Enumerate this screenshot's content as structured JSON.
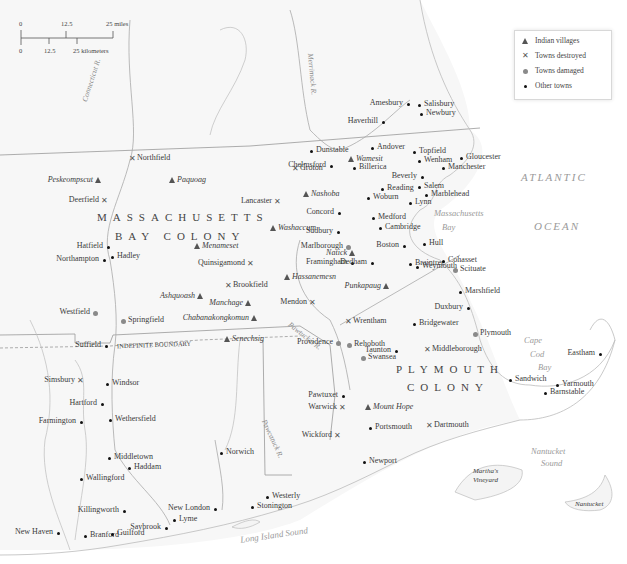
{
  "scale_bar": {
    "miles": [
      "0",
      "12.5",
      "25 miles"
    ],
    "kilometers": [
      "0",
      "12.5",
      "25 kilometers"
    ]
  },
  "legend": {
    "items": [
      {
        "symbol": "triangle",
        "label": "Indian villages"
      },
      {
        "symbol": "x-mark",
        "label": "Towns destroyed"
      },
      {
        "symbol": "gray-dot",
        "label": "Towns damaged"
      },
      {
        "symbol": "black-dot",
        "label": "Other towns"
      }
    ]
  },
  "regions": {
    "massachusetts_line1": "MASSACHUSETTS",
    "massachusetts_line2": "BAY COLONY",
    "plymouth_line1": "PLYMOUTH",
    "plymouth_line2": "COLONY",
    "indefinite_boundary": "INDEFINITE BOUNDARY"
  },
  "water": {
    "atlantic": "ATLANTIC",
    "ocean": "OCEAN",
    "mass_bay_1": "Massachusetts",
    "mass_bay_2": "Bay",
    "cape_cod_1": "Cape",
    "cape_cod_2": "Cod",
    "cape_cod_3": "Bay",
    "nantucket_sound_1": "Nantucket",
    "nantucket_sound_2": "Sound",
    "long_island_sound": "Long Island Sound",
    "marthas_vineyard_1": "Martha's",
    "marthas_vineyard_2": "Vineyard",
    "nantucket": "Nantucket"
  },
  "rivers": {
    "connecticut": "Connecticut R.",
    "merrimack": "Merrimack R.",
    "pawtucket": "Pawtucket R.",
    "pawcatuck": "Pawcatuck R."
  },
  "places": {
    "indian_villages": [
      {
        "name": "Peskeompscut",
        "x": 98,
        "y": 181
      },
      {
        "name": "Paquoag",
        "x": 172,
        "y": 181
      },
      {
        "name": "Wamesit",
        "x": 351,
        "y": 160
      },
      {
        "name": "Nashoba",
        "x": 306,
        "y": 195
      },
      {
        "name": "Washaccum",
        "x": 273,
        "y": 229
      },
      {
        "name": "Menameset",
        "x": 197,
        "y": 247
      },
      {
        "name": "Natick",
        "x": 352,
        "y": 254
      },
      {
        "name": "Hassanemesn",
        "x": 287,
        "y": 278
      },
      {
        "name": "Punkapaug",
        "x": 386,
        "y": 287
      },
      {
        "name": "Ashquoash",
        "x": 200,
        "y": 297
      },
      {
        "name": "Manchage",
        "x": 248,
        "y": 304
      },
      {
        "name": "Chabanakongkomun",
        "x": 254,
        "y": 319
      },
      {
        "name": "Senechsig",
        "x": 227,
        "y": 340
      },
      {
        "name": "Mount Hope",
        "x": 368,
        "y": 408
      }
    ],
    "towns_destroyed": [
      {
        "name": "Northfield",
        "x": 132,
        "y": 159
      },
      {
        "name": "Deerfield",
        "x": 104,
        "y": 201
      },
      {
        "name": "Groton",
        "x": 295,
        "y": 169
      },
      {
        "name": "Lancaster",
        "x": 277,
        "y": 202
      },
      {
        "name": "Quinsigamond",
        "x": 250,
        "y": 264
      },
      {
        "name": "Brookfield",
        "x": 228,
        "y": 286
      },
      {
        "name": "Mendon",
        "x": 312,
        "y": 303
      },
      {
        "name": "Wrentham",
        "x": 348,
        "y": 322
      },
      {
        "name": "Middleborough",
        "x": 427,
        "y": 350
      },
      {
        "name": "Simsbury",
        "x": 80,
        "y": 381
      },
      {
        "name": "Warwick",
        "x": 342,
        "y": 408
      },
      {
        "name": "Wickford",
        "x": 337,
        "y": 436
      },
      {
        "name": "Dartmouth",
        "x": 429,
        "y": 426
      }
    ],
    "towns_damaged": [
      {
        "name": "Marlborough",
        "x": 348,
        "y": 247
      },
      {
        "name": "Westfield",
        "x": 95,
        "y": 313
      },
      {
        "name": "Springfield",
        "x": 123,
        "y": 321
      },
      {
        "name": "Providence",
        "x": 338,
        "y": 343
      },
      {
        "name": "Rehoboth",
        "x": 349,
        "y": 345
      },
      {
        "name": "Swansea",
        "x": 363,
        "y": 358
      },
      {
        "name": "Scituate",
        "x": 455,
        "y": 270
      },
      {
        "name": "Plymouth",
        "x": 475,
        "y": 334
      }
    ],
    "other_towns": [
      {
        "name": "Amesbury",
        "x": 408,
        "y": 104
      },
      {
        "name": "Salisbury",
        "x": 419,
        "y": 105
      },
      {
        "name": "Newbury",
        "x": 421,
        "y": 114
      },
      {
        "name": "Haverhill",
        "x": 383,
        "y": 122
      },
      {
        "name": "Dunstable",
        "x": 311,
        "y": 151
      },
      {
        "name": "Andover",
        "x": 372,
        "y": 148
      },
      {
        "name": "Topfield",
        "x": 414,
        "y": 152
      },
      {
        "name": "Wenham",
        "x": 419,
        "y": 161
      },
      {
        "name": "Gloucester",
        "x": 461,
        "y": 158
      },
      {
        "name": "Manchester",
        "x": 443,
        "y": 168
      },
      {
        "name": "Chelmsford",
        "x": 331,
        "y": 166
      },
      {
        "name": "Billerica",
        "x": 354,
        "y": 168
      },
      {
        "name": "Beverly",
        "x": 422,
        "y": 177
      },
      {
        "name": "Salem",
        "x": 419,
        "y": 187
      },
      {
        "name": "Reading",
        "x": 382,
        "y": 189
      },
      {
        "name": "Marblehead",
        "x": 426,
        "y": 195
      },
      {
        "name": "Woburn",
        "x": 368,
        "y": 198
      },
      {
        "name": "Lynn",
        "x": 410,
        "y": 203
      },
      {
        "name": "Concord",
        "x": 339,
        "y": 213
      },
      {
        "name": "Medford",
        "x": 373,
        "y": 218
      },
      {
        "name": "Cambridge",
        "x": 380,
        "y": 228
      },
      {
        "name": "Sudbury",
        "x": 338,
        "y": 232
      },
      {
        "name": "Boston",
        "x": 404,
        "y": 246
      },
      {
        "name": "Hull",
        "x": 424,
        "y": 244
      },
      {
        "name": "Framingham",
        "x": 352,
        "y": 263
      },
      {
        "name": "Dedham",
        "x": 372,
        "y": 263
      },
      {
        "name": "Braintree",
        "x": 410,
        "y": 264
      },
      {
        "name": "Weymouth",
        "x": 417,
        "y": 267
      },
      {
        "name": "Cohasset",
        "x": 443,
        "y": 261
      },
      {
        "name": "Marshfield",
        "x": 460,
        "y": 292
      },
      {
        "name": "Duxbury",
        "x": 468,
        "y": 308
      },
      {
        "name": "Bridgewater",
        "x": 414,
        "y": 324
      },
      {
        "name": "Taunton",
        "x": 396,
        "y": 351
      },
      {
        "name": "Hatfield",
        "x": 108,
        "y": 247
      },
      {
        "name": "Northampton",
        "x": 104,
        "y": 260
      },
      {
        "name": "Hadley",
        "x": 112,
        "y": 257
      },
      {
        "name": "Suffield",
        "x": 106,
        "y": 346
      },
      {
        "name": "Windsor",
        "x": 107,
        "y": 384
      },
      {
        "name": "Hartford",
        "x": 102,
        "y": 404
      },
      {
        "name": "Wethersfield",
        "x": 110,
        "y": 420
      },
      {
        "name": "Farmington",
        "x": 81,
        "y": 422
      },
      {
        "name": "Middletown",
        "x": 109,
        "y": 458
      },
      {
        "name": "Haddam",
        "x": 129,
        "y": 468
      },
      {
        "name": "Wallingford",
        "x": 81,
        "y": 479
      },
      {
        "name": "Killingworth",
        "x": 124,
        "y": 511
      },
      {
        "name": "New Haven",
        "x": 58,
        "y": 533
      },
      {
        "name": "Branford",
        "x": 85,
        "y": 536
      },
      {
        "name": "Guilford",
        "x": 112,
        "y": 534
      },
      {
        "name": "Saybrook",
        "x": 166,
        "y": 528
      },
      {
        "name": "Lyme",
        "x": 174,
        "y": 520
      },
      {
        "name": "New London",
        "x": 215,
        "y": 509
      },
      {
        "name": "Norwich",
        "x": 221,
        "y": 453
      },
      {
        "name": "Westerly",
        "x": 267,
        "y": 497
      },
      {
        "name": "Stonington",
        "x": 252,
        "y": 507
      },
      {
        "name": "Pawtuxet",
        "x": 343,
        "y": 396
      },
      {
        "name": "Portsmouth",
        "x": 370,
        "y": 428
      },
      {
        "name": "Newport",
        "x": 364,
        "y": 462
      },
      {
        "name": "Sandwich",
        "x": 510,
        "y": 380
      },
      {
        "name": "Yarmouth",
        "x": 557,
        "y": 385
      },
      {
        "name": "Barnstable",
        "x": 545,
        "y": 393
      },
      {
        "name": "Eastham",
        "x": 600,
        "y": 354
      }
    ]
  }
}
